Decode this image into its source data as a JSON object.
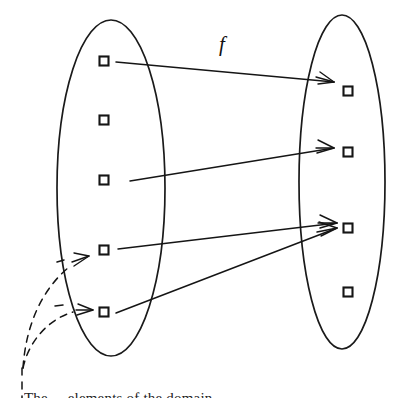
{
  "figure": {
    "type": "set-mapping-diagram",
    "function_label": "f",
    "caption_partial": "The ... elements of the domain",
    "colors": {
      "ink": "#151515",
      "background": "#ffffff"
    },
    "domain_set": {
      "name": "domain",
      "shape": "ellipse",
      "cx": 111,
      "cy": 188,
      "rx": 54,
      "ry": 168,
      "elements": [
        {
          "id": "d1",
          "x": 104,
          "y": 61
        },
        {
          "id": "d2",
          "x": 104,
          "y": 120
        },
        {
          "id": "d3",
          "x": 104,
          "y": 180
        },
        {
          "id": "d4",
          "x": 104,
          "y": 250
        },
        {
          "id": "d5",
          "x": 104,
          "y": 312
        }
      ]
    },
    "codomain_set": {
      "name": "codomain",
      "shape": "ellipse",
      "cx": 342,
      "cy": 182,
      "rx": 43,
      "ry": 167,
      "elements": [
        {
          "id": "c1",
          "x": 348,
          "y": 91
        },
        {
          "id": "c2",
          "x": 348,
          "y": 152
        },
        {
          "id": "c3",
          "x": 348,
          "y": 228
        },
        {
          "id": "c4",
          "x": 348,
          "y": 292
        }
      ]
    },
    "element_square_size": 9,
    "mappings": [
      {
        "id": "m1",
        "from": "d1",
        "to": "c1",
        "x1": 116,
        "y1": 62,
        "x2": 334,
        "y2": 82
      },
      {
        "id": "m2",
        "from": "d3",
        "to": "c2",
        "x1": 130,
        "y1": 181,
        "x2": 332,
        "y2": 148
      },
      {
        "id": "m3",
        "from": "d4",
        "to": "c3",
        "x1": 118,
        "y1": 249,
        "x2": 336,
        "y2": 224
      },
      {
        "id": "m4",
        "from": "d5",
        "to": "c3",
        "x1": 116,
        "y1": 313,
        "x2": 336,
        "y2": 228
      }
    ],
    "preimage_arrows": [
      {
        "id": "p1",
        "to": "d4",
        "path": "M 22 372 C 28 318, 48 286, 70 268",
        "head_x": 89,
        "head_y": 256,
        "angle": -32
      },
      {
        "id": "p2",
        "to": "d5",
        "path": "M 22 372 C 30 344, 48 320, 74 312",
        "head_x": 92,
        "head_y": 309,
        "angle": -8
      }
    ],
    "preimage_stem": {
      "x1": 22,
      "y1": 372,
      "x2": 22,
      "y2": 398
    },
    "function_label_pos": {
      "x": 222,
      "y": 51
    }
  }
}
